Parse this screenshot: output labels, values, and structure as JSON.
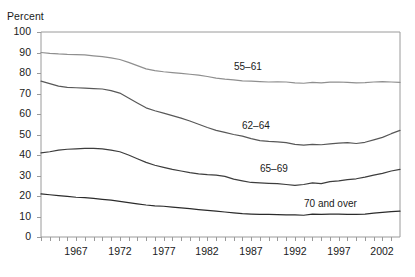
{
  "chart_data": {
    "type": "line",
    "title": "",
    "ylabel": "Percent",
    "xlabel": "",
    "ylim": [
      0,
      100
    ],
    "xlim": [
      1963,
      2004
    ],
    "grid": false,
    "legend_position": "inline-annotations",
    "ytick_labels": [
      "100",
      "90",
      "80",
      "70",
      "60",
      "50",
      "40",
      "30",
      "20",
      "10",
      "0"
    ],
    "ytick_values": [
      100,
      90,
      80,
      70,
      60,
      50,
      40,
      30,
      20,
      10,
      0
    ],
    "xtick_labels": [
      "1967",
      "1972",
      "1977",
      "1982",
      "1987",
      "1992",
      "1997",
      "2002"
    ],
    "xtick_values": [
      1967,
      1972,
      1977,
      1982,
      1987,
      1992,
      1997,
      2002
    ],
    "x": [
      1963,
      1964,
      1965,
      1966,
      1967,
      1968,
      1969,
      1970,
      1971,
      1972,
      1973,
      1974,
      1975,
      1976,
      1977,
      1978,
      1979,
      1980,
      1981,
      1982,
      1983,
      1984,
      1985,
      1986,
      1987,
      1988,
      1989,
      1990,
      1991,
      1992,
      1993,
      1994,
      1995,
      1996,
      1997,
      1998,
      1999,
      2000,
      2001,
      2002,
      2003,
      2004
    ],
    "series": [
      {
        "name": "55–61",
        "color": "#8f8f8f",
        "label_x": 1985,
        "label_y": 83,
        "values": [
          90.0,
          89.6,
          89.3,
          89.1,
          89.0,
          88.8,
          88.4,
          88.0,
          87.4,
          86.6,
          85.2,
          83.6,
          82.0,
          81.2,
          80.6,
          80.2,
          79.8,
          79.4,
          79.0,
          78.3,
          77.5,
          77.0,
          76.6,
          76.2,
          76.0,
          75.8,
          75.6,
          75.7,
          75.6,
          75.2,
          75.0,
          75.4,
          75.2,
          75.5,
          75.6,
          75.4,
          75.2,
          75.3,
          75.6,
          75.8,
          75.6,
          75.4
        ]
      },
      {
        "name": "62–64",
        "color": "#585858",
        "label_x": 1986,
        "label_y": 54,
        "values": [
          76.0,
          74.8,
          73.6,
          73.0,
          72.8,
          72.6,
          72.4,
          72.2,
          71.4,
          70.2,
          67.8,
          65.4,
          63.0,
          61.6,
          60.4,
          59.2,
          58.0,
          56.6,
          55.0,
          53.4,
          52.0,
          51.0,
          50.0,
          49.2,
          48.0,
          47.0,
          46.6,
          46.4,
          46.0,
          45.2,
          44.8,
          45.2,
          45.0,
          45.4,
          45.8,
          46.0,
          45.6,
          46.2,
          47.4,
          48.6,
          50.4,
          52.0
        ]
      },
      {
        "name": "65–69",
        "color": "#3d3d3d",
        "label_x": 1988,
        "label_y": 33,
        "values": [
          41.0,
          41.6,
          42.4,
          42.8,
          43.0,
          43.2,
          43.2,
          43.0,
          42.4,
          41.6,
          40.0,
          38.2,
          36.4,
          35.0,
          34.0,
          33.0,
          32.2,
          31.4,
          30.8,
          30.4,
          30.2,
          29.6,
          28.2,
          27.4,
          26.6,
          26.4,
          26.2,
          26.0,
          25.6,
          25.2,
          25.6,
          26.4,
          26.0,
          27.0,
          27.4,
          28.0,
          28.4,
          29.2,
          30.2,
          31.0,
          32.2,
          33.0
        ]
      },
      {
        "name": "70 and over",
        "color": "#2b2b2b",
        "label_x": 1993,
        "label_y": 16,
        "values": [
          21.0,
          20.6,
          20.2,
          19.8,
          19.4,
          19.2,
          18.8,
          18.4,
          18.0,
          17.4,
          16.8,
          16.2,
          15.6,
          15.2,
          15.0,
          14.6,
          14.2,
          13.8,
          13.4,
          13.0,
          12.6,
          12.2,
          11.8,
          11.4,
          11.2,
          11.0,
          11.0,
          10.9,
          10.8,
          10.8,
          10.6,
          11.2,
          11.0,
          11.2,
          11.2,
          11.0,
          11.0,
          11.2,
          11.6,
          12.0,
          12.4,
          12.6
        ]
      }
    ]
  }
}
